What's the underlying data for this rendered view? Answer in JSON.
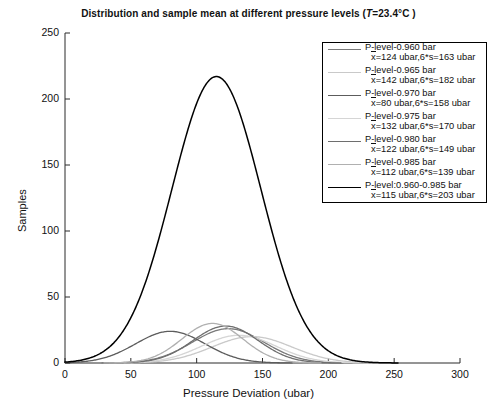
{
  "chart_data": {
    "type": "line",
    "title_parts": {
      "main": "Distribution and sample mean at different pressure levels (",
      "italic_var": "T",
      "tail": "=23.4°C )"
    },
    "xlabel": "Pressure Deviation (ubar)",
    "ylabel": "Samples",
    "xlim": [
      0,
      300
    ],
    "ylim": [
      0,
      250
    ],
    "xticks": [
      0,
      50,
      100,
      150,
      200,
      250,
      300
    ],
    "yticks": [
      0,
      50,
      100,
      150,
      200,
      250
    ],
    "grid": false,
    "legend_position": "upper-right",
    "series": [
      {
        "name": "P-level-0.960 bar",
        "stat_line": "x=124 ubar,6*s=163 ubar",
        "mean": 124,
        "six_sigma": 163,
        "peak": 26,
        "color": "#7a7a7a"
      },
      {
        "name": "P-level-0.965 bar",
        "stat_line": "x=142 ubar,6*s=182 ubar",
        "mean": 142,
        "six_sigma": 182,
        "peak": 20,
        "color": "#c9c9c9"
      },
      {
        "name": "P-level-0.970 bar",
        "stat_line": "x=80 ubar,6*s=158 ubar",
        "mean": 80,
        "six_sigma": 158,
        "peak": 24,
        "color": "#5c5c5c"
      },
      {
        "name": "P-level-0.975 bar",
        "stat_line": "x=132 ubar,6*s=170 ubar",
        "mean": 132,
        "six_sigma": 170,
        "peak": 21,
        "color": "#d5d5d5"
      },
      {
        "name": "P-level-0.980 bar",
        "stat_line": "x=122 ubar,6*s=149 ubar",
        "mean": 122,
        "six_sigma": 149,
        "peak": 28,
        "color": "#6e6e6e"
      },
      {
        "name": "P-level-0.985 bar",
        "stat_line": "x=112 ubar,6*s=139 ubar",
        "mean": 112,
        "six_sigma": 139,
        "peak": 30,
        "color": "#b0b0b0"
      },
      {
        "name": "P-level:0.960-0.985 bar",
        "stat_line": "x=115 ubar,6*s=203 ubar",
        "mean": 115,
        "six_sigma": 203,
        "peak": 217,
        "color": "#000000"
      }
    ]
  },
  "axes": {
    "x_tick_labels": [
      "0",
      "50",
      "100",
      "150",
      "200",
      "250",
      "300"
    ],
    "y_tick_labels": [
      "0",
      "50",
      "100",
      "150",
      "200",
      "250"
    ],
    "x_axis_label": "Pressure Deviation (ubar)",
    "y_axis_label": "Samples"
  },
  "legend": {
    "entries": [
      {
        "title": "P-level-0.960 bar",
        "stats": "x=124 ubar,6*s=163 ubar"
      },
      {
        "title": "P-level-0.965 bar",
        "stats": "x=142 ubar,6*s=182 ubar"
      },
      {
        "title": "P-level-0.970 bar",
        "stats": "x=80 ubar,6*s=158 ubar"
      },
      {
        "title": "P-level-0.975 bar",
        "stats": "x=132 ubar,6*s=170 ubar"
      },
      {
        "title": "P-level-0.980 bar",
        "stats": "x=122 ubar,6*s=149 ubar"
      },
      {
        "title": "P-level-0.985 bar",
        "stats": "x=112 ubar,6*s=139 ubar"
      },
      {
        "title": "P-level:0.960-0.985 bar",
        "stats": "x=115 ubar,6*s=203 ubar"
      }
    ]
  }
}
